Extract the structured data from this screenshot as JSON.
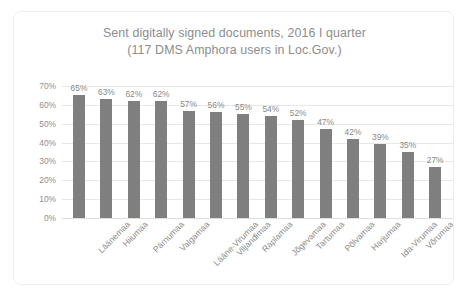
{
  "chart_data": {
    "type": "bar",
    "title": "Sent digitally signed documents, 2016 I quarter",
    "subtitle": "(117 DMS Amphora users in Loc.Gov.)",
    "title_lines": [
      "Sent digitally signed documents, 2016 I quarter",
      "(117 DMS Amphora users in Loc.Gov.)"
    ],
    "categories": [
      "Läänemaa",
      "Hiiumaa",
      "Pärnumaa",
      "Valgamaa",
      "Lääne-Virumaa",
      "Viljandimaa",
      "Raplamaa",
      "Jõgevamaa",
      "Tartumaa",
      "Põlvamaa",
      "Harjumaa",
      "Ida-Virumaa",
      "Võrumaa",
      "Saaremaa"
    ],
    "values": [
      65,
      63,
      62,
      62,
      57,
      56,
      55,
      54,
      52,
      47,
      42,
      39,
      35,
      27
    ],
    "value_labels": [
      "65%",
      "63%",
      "62%",
      "62%",
      "57%",
      "56%",
      "55%",
      "54%",
      "52%",
      "47%",
      "42%",
      "39%",
      "35%",
      "27%"
    ],
    "xlabel": "",
    "ylabel": "",
    "ylim": [
      0,
      70
    ],
    "yticks": [
      70,
      60,
      50,
      40,
      30,
      20,
      10,
      0
    ],
    "ytick_labels": [
      "70%",
      "60%",
      "50%",
      "40%",
      "30%",
      "20%",
      "10%",
      "0%"
    ],
    "grid": true,
    "legend": false,
    "series_color": "#7f7f7f",
    "text_color": "#8a8a8a",
    "gridline_color": "#e6e8ea",
    "background": "#ffffff"
  }
}
